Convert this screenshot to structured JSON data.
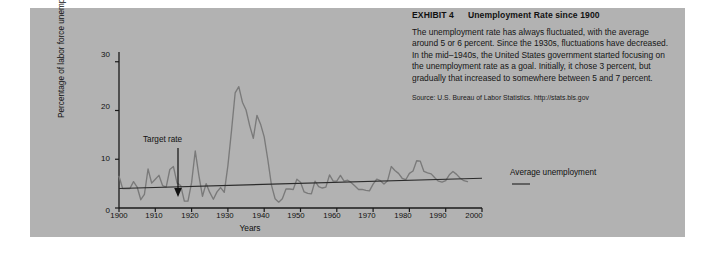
{
  "exhibit": {
    "number_label": "EXHIBIT 4",
    "title": "Unemployment Rate since 1900",
    "body": "The unemployment rate has always fluctuated, with the average around 5 or 6 percent. Since the 1930s, fluctuations have decreased. In the mid–1940s, the United States government started focusing on the unemployment rate as a goal. Initially, it chose 3 percent, but gradually that increased to somewhere between 5 and 7 percent.",
    "source": "Source: U.S. Bureau of Labor Statistics. http://stats.bls.gov"
  },
  "annotations": {
    "target_rate": "Target rate",
    "average_unemployment": "Average unemployment"
  },
  "colors": {
    "panel_background": "#b2b2b2",
    "page_background": "#ffffff",
    "axis": "#1a1a1a",
    "series_line": "#7a7a7a",
    "trend_line": "#2b2b2b",
    "text": "#111111"
  },
  "chart_data": {
    "type": "line",
    "title": "Unemployment Rate since 1900",
    "xlabel": "Years",
    "ylabel": "Percentage of labor force unemployed",
    "xlim": [
      1900,
      2000
    ],
    "ylim": [
      0,
      32
    ],
    "grid": false,
    "legend_position": "inline-annotation",
    "xticks": [
      1900,
      1910,
      1920,
      1930,
      1940,
      1950,
      1960,
      1970,
      1980,
      1990,
      2000
    ],
    "xtick_labels": [
      "1900",
      "1910",
      "1920",
      "1930",
      "1940",
      "1950",
      "1960",
      "1970",
      "1980",
      "1990",
      "2000"
    ],
    "yticks": [
      0,
      10,
      20,
      30
    ],
    "ytick_labels": [
      "0",
      "10",
      "20",
      "30"
    ],
    "series": [
      {
        "name": "Unemployment rate",
        "color": "#7a7a7a",
        "x": [
          1900,
          1901,
          1902,
          1903,
          1904,
          1905,
          1906,
          1907,
          1908,
          1909,
          1910,
          1911,
          1912,
          1913,
          1914,
          1915,
          1916,
          1917,
          1918,
          1919,
          1920,
          1921,
          1922,
          1923,
          1924,
          1925,
          1926,
          1927,
          1928,
          1929,
          1930,
          1931,
          1932,
          1933,
          1934,
          1935,
          1936,
          1937,
          1938,
          1939,
          1940,
          1941,
          1942,
          1943,
          1944,
          1945,
          1946,
          1947,
          1948,
          1949,
          1950,
          1951,
          1952,
          1953,
          1954,
          1955,
          1956,
          1957,
          1958,
          1959,
          1960,
          1961,
          1962,
          1963,
          1964,
          1965,
          1966,
          1967,
          1968,
          1969,
          1970,
          1971,
          1972,
          1973,
          1974,
          1975,
          1976,
          1977,
          1978,
          1979,
          1980,
          1981,
          1982,
          1983,
          1984,
          1985,
          1986,
          1987,
          1988,
          1989,
          1990,
          1991,
          1992,
          1993,
          1994,
          1995,
          1996
        ],
        "y": [
          6.5,
          4.0,
          4.0,
          4.0,
          5.4,
          4.3,
          1.7,
          2.8,
          8.0,
          5.1,
          5.9,
          6.7,
          4.6,
          4.3,
          7.9,
          8.5,
          5.1,
          4.6,
          1.4,
          1.4,
          5.2,
          11.7,
          6.7,
          2.4,
          5.0,
          3.2,
          1.8,
          3.3,
          4.2,
          3.2,
          8.7,
          15.9,
          23.6,
          24.9,
          21.7,
          20.1,
          16.9,
          14.3,
          19.0,
          17.2,
          14.6,
          9.9,
          4.7,
          1.9,
          1.2,
          1.9,
          3.9,
          3.9,
          3.8,
          5.9,
          5.3,
          3.3,
          3.0,
          2.9,
          5.5,
          4.4,
          4.1,
          4.3,
          6.8,
          5.5,
          5.5,
          6.7,
          5.5,
          5.7,
          5.2,
          4.5,
          3.8,
          3.8,
          3.6,
          3.5,
          4.9,
          5.9,
          5.6,
          4.9,
          5.6,
          8.5,
          7.7,
          7.1,
          6.1,
          5.8,
          7.1,
          7.6,
          9.7,
          9.6,
          7.5,
          7.2,
          7.0,
          6.2,
          5.5,
          5.3,
          5.6,
          6.8,
          7.5,
          6.9,
          6.1,
          5.6,
          5.4
        ]
      },
      {
        "name": "Average unemployment",
        "color": "#2b2b2b",
        "x": [
          1900,
          2000
        ],
        "y": [
          4.0,
          6.1
        ]
      }
    ],
    "annotations": [
      {
        "text": "Target rate",
        "x": 1920,
        "y": 15,
        "arrow_to_y": 4.5
      },
      {
        "text": "Average unemployment",
        "x": 1995,
        "y": 5.5
      }
    ]
  }
}
